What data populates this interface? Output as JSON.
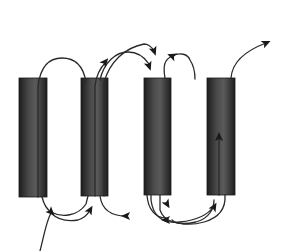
{
  "diagram": {
    "type": "transmembrane-helix-topology",
    "colors": {
      "background": "#ffffff",
      "helix_dark": "#1c1c1c",
      "helix_mid": "#5a5a5a",
      "line": "#2a2a2a"
    },
    "helices": [
      {
        "id": "helix-1",
        "x": 19,
        "y": 78,
        "w": 28,
        "h": 119
      },
      {
        "id": "helix-2",
        "x": 81,
        "y": 78,
        "w": 27,
        "h": 118
      },
      {
        "id": "helix-3",
        "x": 144,
        "y": 78,
        "w": 27,
        "h": 117
      },
      {
        "id": "helix-4",
        "x": 207,
        "y": 78,
        "w": 28,
        "h": 117
      }
    ],
    "paths": [
      {
        "id": "n-terminus-entry",
        "d": "M 40 251 C 44 236, 46 222, 51 213"
      },
      {
        "id": "loop-1-2-top",
        "d": "M 38 197 L 38 86 C 40 70, 46 58, 62 58 C 78 58, 84 70, 86 82"
      },
      {
        "id": "loop-2-top-left",
        "d": "M 95 196 L 95 86 C 96 76, 100 68, 106 62"
      },
      {
        "id": "loop-2-3-top-long",
        "d": "M 104 196 L 104 82 C 110 62, 124 48, 144 44 C 148 44, 150 46, 154 50"
      },
      {
        "id": "loop-2-3-top-short",
        "d": "M 100 80 C 104 62, 116 52, 128 52 C 138 52, 145 58, 149 64"
      },
      {
        "id": "loop-3-top",
        "d": "M 165 78 C 163 66, 164 60, 172 56 C 180 52, 188 54, 190 60 C 194 66, 195 72, 195 79"
      },
      {
        "id": "loop-4-top-exit",
        "d": "M 231 78 C 232 64, 242 52, 266 43"
      },
      {
        "id": "helix-4-inner",
        "d": "M 219 195 L 219 137"
      },
      {
        "id": "loop-1-2-bottom",
        "d": "M 42 197 C 44 205, 48 210, 51 212 C 62 218, 78 216, 86 204 L 88 196"
      },
      {
        "id": "loop-1-bottom-arrow",
        "d": "M 51 213 C 58 220, 66 222, 78 220 C 84 218, 88 214, 90 210"
      },
      {
        "id": "loop-2-3-bottom",
        "d": "M 100 196 C 102 210, 112 216, 126 216"
      },
      {
        "id": "loop-3-bottom-a",
        "d": "M 151 195 L 151 200 C 153 216, 162 224, 180 222 C 200 220, 210 212, 214 206"
      },
      {
        "id": "loop-3-bottom-b",
        "d": "M 160 195 L 160 210 C 164 222, 178 226, 196 222 C 210 218, 214 208, 214 200"
      },
      {
        "id": "loop-3-4-bottom",
        "d": "M 147 195 C 148 210, 156 218, 166 218"
      },
      {
        "id": "loop-4-bottom",
        "d": "M 225 195 C 226 210, 218 218, 204 222 C 190 226, 176 224, 172 220"
      }
    ],
    "arrowheads": [
      {
        "id": "arrow-n-junction",
        "x": 51,
        "y": 212,
        "angle": 45
      },
      {
        "id": "arrow-loop-1-bottom",
        "x": 90,
        "y": 210,
        "angle": -60
      },
      {
        "id": "arrow-2-3-bottom",
        "x": 126,
        "y": 216,
        "angle": 180
      },
      {
        "id": "arrow-helix-2-top",
        "x": 105,
        "y": 62,
        "angle": -50
      },
      {
        "id": "arrow-helix-3-top-long",
        "x": 154,
        "y": 51,
        "angle": 70
      },
      {
        "id": "arrow-helix-3-top-short",
        "x": 149,
        "y": 66,
        "angle": 70
      },
      {
        "id": "arrow-loop-3-top",
        "x": 172,
        "y": 56,
        "angle": 200
      },
      {
        "id": "arrow-exit",
        "x": 266,
        "y": 43,
        "angle": -25
      },
      {
        "id": "arrow-helix-4-inner",
        "x": 219,
        "y": 137,
        "angle": -90
      },
      {
        "id": "arrow-loop-3-bottom",
        "x": 167,
        "y": 204,
        "angle": 60
      },
      {
        "id": "arrow-loop-4-bottom-left",
        "x": 166,
        "y": 220,
        "angle": 180
      },
      {
        "id": "arrow-loop-4-bottom-right",
        "x": 214,
        "y": 207,
        "angle": -60
      }
    ]
  }
}
